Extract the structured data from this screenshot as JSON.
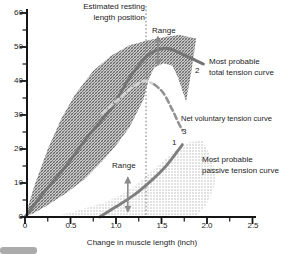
{
  "chart_data": {
    "type": "line",
    "title": "",
    "xlabel": "Change in muscle length (inch)",
    "ylabel": "",
    "xlim": [
      0,
      2.5
    ],
    "ylim": [
      0,
      60
    ],
    "grid": false,
    "legend_position": "inline-annotations",
    "x_ticks": [
      0,
      0.5,
      1.0,
      1.5,
      2.0,
      2.5
    ],
    "x_tick_labels": [
      "0",
      "0.5",
      "1.0",
      "1.5",
      "2.0",
      "2.5"
    ],
    "x_minor_ticks": [
      0.25,
      0.75,
      1.25,
      1.75,
      2.25
    ],
    "y_ticks": [
      0,
      10,
      20,
      30,
      40,
      50,
      60
    ],
    "y_tick_labels": [
      "60",
      "50",
      "40",
      "30",
      "20",
      "10",
      "0"
    ],
    "y_minor_ticks": [
      5,
      15,
      25,
      35,
      45,
      55
    ],
    "resting_length_x": 1.33,
    "annotations": {
      "resting_line1": "Estimated resting",
      "resting_line2": "length position",
      "range_top": "Range",
      "range_bottom": "Range",
      "total_label_1": "Most probable",
      "total_label_2": "total tension curve",
      "net_label": "Net voluntary tension curve",
      "passive_label_1": "Most probable",
      "passive_label_2": "passive tension curve"
    },
    "range_arrows": [
      {
        "x": 1.46,
        "y1": 53.0,
        "y2": 44.8
      },
      {
        "x": 1.13,
        "y1": 11.6,
        "y2": 1.6
      }
    ],
    "series": [
      {
        "name": "Most probable passive tension curve",
        "number": "1",
        "style": "solid",
        "color": "#7e7e7e",
        "width": 2.8,
        "points": [
          [
            0.82,
            0
          ],
          [
            1.0,
            3
          ],
          [
            1.2,
            6.5
          ],
          [
            1.4,
            11
          ],
          [
            1.55,
            15
          ],
          [
            1.68,
            19.5
          ],
          [
            1.73,
            21.3
          ]
        ]
      },
      {
        "name": "Most probable total tension curve",
        "number": "2",
        "style": "solid",
        "color": "#747474",
        "width": 3,
        "points": [
          [
            0,
            0
          ],
          [
            0.2,
            7
          ],
          [
            0.45,
            15
          ],
          [
            0.7,
            24
          ],
          [
            0.95,
            32
          ],
          [
            1.15,
            41
          ],
          [
            1.35,
            47.5
          ],
          [
            1.5,
            49.5
          ],
          [
            1.62,
            49.2
          ],
          [
            1.8,
            47
          ],
          [
            1.96,
            45
          ]
        ]
      },
      {
        "name": "Net voluntary tension curve",
        "number": "3",
        "style": "dashed",
        "color": "#929292",
        "in_band_color": "#d3d3d3",
        "split_x": 1.32,
        "width": 2.6,
        "points": [
          [
            0.85,
            30.5
          ],
          [
            1.0,
            34
          ],
          [
            1.15,
            37.5
          ],
          [
            1.3,
            40
          ],
          [
            1.42,
            39
          ],
          [
            1.52,
            36.5
          ],
          [
            1.62,
            31.5
          ],
          [
            1.69,
            27.5
          ],
          [
            1.73,
            25.5
          ]
        ]
      }
    ],
    "bands": [
      {
        "name": "total tension range (crosshatched)",
        "pattern": "hatchDark",
        "points": [
          [
            0,
            0
          ],
          [
            0.1,
            9
          ],
          [
            0.25,
            20
          ],
          [
            0.4,
            29
          ],
          [
            0.55,
            36
          ],
          [
            0.75,
            43
          ],
          [
            0.95,
            47.5
          ],
          [
            1.15,
            50.5
          ],
          [
            1.35,
            52
          ],
          [
            1.55,
            53
          ],
          [
            1.7,
            53.5
          ],
          [
            1.88,
            52.5
          ],
          [
            1.83,
            43
          ],
          [
            1.77,
            34
          ],
          [
            1.68,
            41
          ],
          [
            1.62,
            44.5
          ],
          [
            1.52,
            45.2
          ],
          [
            1.42,
            44
          ],
          [
            1.36,
            40.5
          ],
          [
            1.3,
            34.5
          ],
          [
            1.15,
            26.5
          ],
          [
            1.0,
            21
          ],
          [
            0.85,
            16.5
          ],
          [
            0.65,
            11
          ],
          [
            0.45,
            7
          ],
          [
            0.25,
            3.5
          ],
          [
            0.1,
            1.2
          ]
        ]
      },
      {
        "name": "passive tension range (dotted)",
        "pattern": "dotsLight",
        "points": [
          [
            0.3,
            0
          ],
          [
            1.88,
            0
          ],
          [
            2.0,
            4
          ],
          [
            2.08,
            9
          ],
          [
            2.1,
            13
          ],
          [
            2.02,
            19
          ],
          [
            1.95,
            22.5
          ],
          [
            1.8,
            22
          ],
          [
            1.65,
            19.5
          ],
          [
            1.5,
            16
          ],
          [
            1.35,
            12.5
          ],
          [
            1.2,
            9
          ],
          [
            1.05,
            6.5
          ],
          [
            0.9,
            4.5
          ],
          [
            0.72,
            3
          ],
          [
            0.52,
            1.5
          ]
        ]
      }
    ]
  }
}
